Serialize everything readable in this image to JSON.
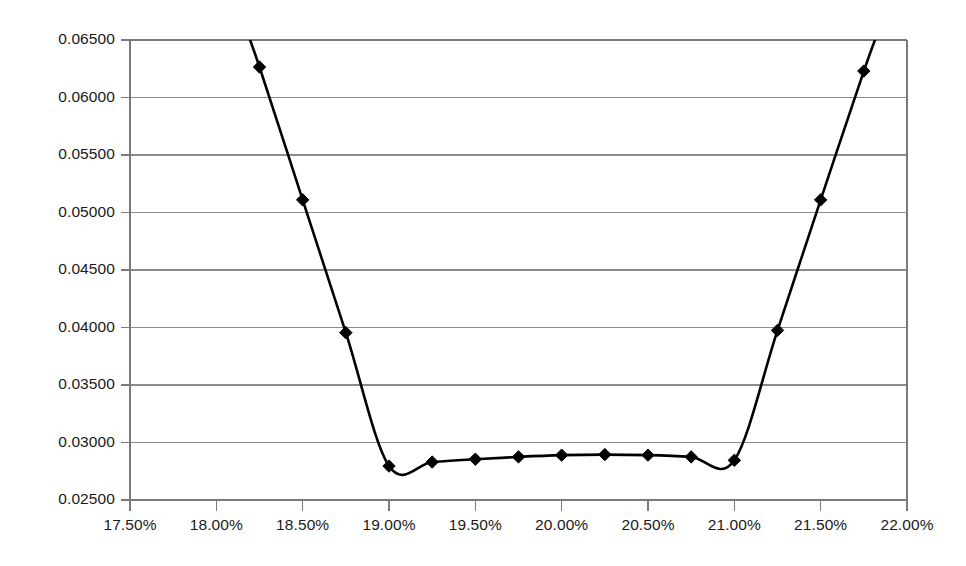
{
  "chart_data": {
    "type": "line",
    "title": "",
    "subtitle": "",
    "xlabel": "",
    "ylabel": "",
    "grid": "horizontal",
    "legend": false,
    "legend_position": "none",
    "marker": "diamond",
    "line_color": "#000000",
    "marker_color": "#000000",
    "grid_color": "#8c8c8c",
    "axis_color": "#7a7a7a",
    "background_color": "#ffffff",
    "xlim": [
      17.5,
      22.0
    ],
    "ylim": [
      0.025,
      0.065
    ],
    "x_tick_labels": [
      "17.50%",
      "18.00%",
      "18.50%",
      "19.00%",
      "19.50%",
      "20.00%",
      "20.50%",
      "21.00%",
      "21.50%",
      "22.00%"
    ],
    "x_tick_values": [
      17.5,
      18.0,
      18.5,
      19.0,
      19.5,
      20.0,
      20.5,
      21.0,
      21.5,
      22.0
    ],
    "y_tick_labels": [
      "0.06500",
      "0.06000",
      "0.05500",
      "0.05000",
      "0.04500",
      "0.04000",
      "0.03500",
      "0.03000",
      "0.02500"
    ],
    "y_tick_values": [
      0.065,
      0.06,
      0.055,
      0.05,
      0.045,
      0.04,
      0.035,
      0.03,
      0.025
    ],
    "x": [
      18.25,
      18.5,
      18.75,
      19.0,
      19.25,
      19.5,
      19.75,
      20.0,
      20.25,
      20.5,
      20.75,
      21.0,
      21.25,
      21.5,
      21.75
    ],
    "values": [
      0.06265,
      0.0511,
      0.03955,
      0.02795,
      0.0283,
      0.02855,
      0.02875,
      0.0289,
      0.02895,
      0.0289,
      0.02875,
      0.02845,
      0.03975,
      0.0511,
      0.0623
    ],
    "clipped_top": true,
    "note_clipping": "Line continues beyond the top of the plot area on both the left and right ends"
  }
}
